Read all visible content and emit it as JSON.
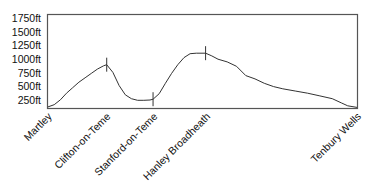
{
  "chart_data": {
    "type": "line",
    "title": "",
    "xlabel": "",
    "ylabel": "",
    "ylim": [
      0,
      1750
    ],
    "grid": false,
    "yticks": [
      "1750ft",
      "1500ft",
      "1250ft",
      "1000ft",
      "750ft",
      "500ft",
      "250ft"
    ],
    "categories": [
      "Martley",
      "Clifton-on-Teme",
      "Stanford-on-Teme",
      "Hanley Broadheath",
      "Tenbury Wells"
    ],
    "waypoint_x_fraction": [
      0.0,
      0.19,
      0.34,
      0.51,
      1.0
    ],
    "series": [
      {
        "name": "Elevation profile",
        "x": [
          0,
          0.02,
          0.04,
          0.06,
          0.08,
          0.1,
          0.12,
          0.14,
          0.16,
          0.18,
          0.19,
          0.21,
          0.23,
          0.25,
          0.27,
          0.29,
          0.31,
          0.33,
          0.34,
          0.36,
          0.38,
          0.4,
          0.42,
          0.44,
          0.46,
          0.48,
          0.51,
          0.53,
          0.55,
          0.58,
          0.61,
          0.64,
          0.67,
          0.7,
          0.73,
          0.76,
          0.8,
          0.84,
          0.88,
          0.92,
          0.95,
          0.97,
          1.0
        ],
        "values": [
          130,
          170,
          260,
          380,
          480,
          580,
          660,
          740,
          820,
          880,
          900,
          760,
          520,
          350,
          280,
          250,
          250,
          255,
          270,
          370,
          560,
          740,
          900,
          1030,
          1100,
          1110,
          1110,
          1060,
          1000,
          950,
          870,
          700,
          640,
          560,
          500,
          460,
          420,
          380,
          330,
          280,
          200,
          150,
          120
        ]
      }
    ]
  }
}
